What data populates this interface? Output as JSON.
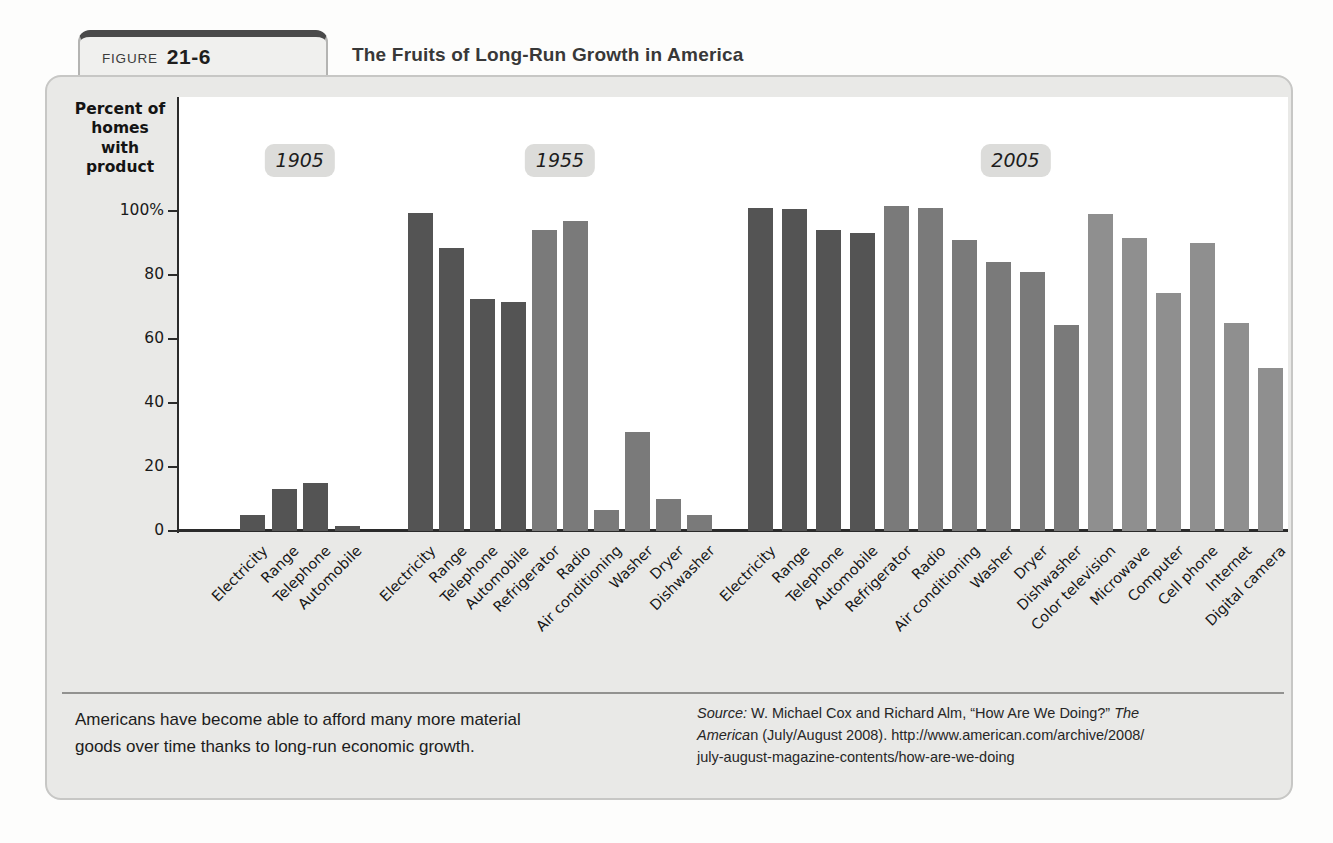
{
  "page": {
    "figure_label": "FIGURE",
    "figure_number": "21-6",
    "title": "The Fruits of Long-Run Growth in America"
  },
  "caption": {
    "line1": "Americans have become able to afford many more material",
    "line2": "goods over time thanks to long-run economic growth."
  },
  "source": {
    "label_italic": "Source:",
    "line1_text": " W. Michael Cox and Richard Alm, “How Are We Doing?” ",
    "line1_tail_italic": "The",
    "line2_head_italic": "America",
    "line2_n": "n",
    "line2_text": " (July/August 2008). http://www.american.com/archive/2008/",
    "line3_text": "july-august-magazine-contents/how-are-we-doing"
  },
  "chart_data": {
    "type": "bar",
    "title": "The Fruits of Long-Run Growth in America",
    "ylabel": "Percent of homes with product",
    "ylim": [
      0,
      110
    ],
    "grid": false,
    "legend": "none",
    "yticks": [
      {
        "value": 100,
        "label": "100%"
      },
      {
        "value": 80,
        "label": "80"
      },
      {
        "value": 60,
        "label": "60"
      },
      {
        "value": 40,
        "label": "40"
      },
      {
        "value": 20,
        "label": "20"
      },
      {
        "value": 0,
        "label": "0"
      }
    ],
    "era_colors": {
      "1905": "#545454",
      "1955": "#7a7a7a",
      "2005": "#8f8f8f"
    },
    "groups": [
      {
        "year": "1905",
        "bars": [
          {
            "label": "Electricity",
            "value": 5,
            "era": "1905"
          },
          {
            "label": "Range",
            "value": 13,
            "era": "1905"
          },
          {
            "label": "Telephone",
            "value": 15,
            "era": "1905"
          },
          {
            "label": "Automobile",
            "value": 1.5,
            "era": "1905"
          }
        ]
      },
      {
        "year": "1955",
        "bars": [
          {
            "label": "Electricity",
            "value": 99.5,
            "era": "1905"
          },
          {
            "label": "Range",
            "value": 88.5,
            "era": "1905"
          },
          {
            "label": "Telephone",
            "value": 72.5,
            "era": "1905"
          },
          {
            "label": "Automobile",
            "value": 71.5,
            "era": "1905"
          },
          {
            "label": "Refrigerator",
            "value": 94,
            "era": "1955"
          },
          {
            "label": "Radio",
            "value": 97,
            "era": "1955"
          },
          {
            "label": "Air conditioning",
            "value": 6.5,
            "era": "1955"
          },
          {
            "label": "Washer",
            "value": 31,
            "era": "1955"
          },
          {
            "label": "Dryer",
            "value": 10,
            "era": "1955"
          },
          {
            "label": "Dishwasher",
            "value": 5,
            "era": "1955"
          }
        ]
      },
      {
        "year": "2005",
        "bars": [
          {
            "label": "Electricity",
            "value": 101,
            "era": "1905"
          },
          {
            "label": "Range",
            "value": 100.5,
            "era": "1905"
          },
          {
            "label": "Telephone",
            "value": 94,
            "era": "1905"
          },
          {
            "label": "Automobile",
            "value": 93,
            "era": "1905"
          },
          {
            "label": "Refrigerator",
            "value": 101.5,
            "era": "1955"
          },
          {
            "label": "Radio",
            "value": 101,
            "era": "1955"
          },
          {
            "label": "Air conditioning",
            "value": 91,
            "era": "1955"
          },
          {
            "label": "Washer",
            "value": 84,
            "era": "1955"
          },
          {
            "label": "Dryer",
            "value": 81,
            "era": "1955"
          },
          {
            "label": "Dishwasher",
            "value": 64.5,
            "era": "1955"
          },
          {
            "label": "Color television",
            "value": 99,
            "era": "2005"
          },
          {
            "label": "Microwave",
            "value": 91.5,
            "era": "2005"
          },
          {
            "label": "Computer",
            "value": 74.5,
            "era": "2005"
          },
          {
            "label": "Cell phone",
            "value": 90,
            "era": "2005"
          },
          {
            "label": "Internet",
            "value": 65,
            "era": "2005"
          },
          {
            "label": "Digital camera",
            "value": 51,
            "era": "2005"
          }
        ]
      }
    ]
  }
}
